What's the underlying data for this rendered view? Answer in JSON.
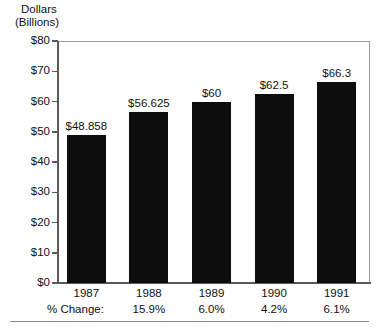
{
  "chart_data": {
    "type": "bar",
    "title": "",
    "ylabel_line1": "Dollars",
    "ylabel_line2": "(Billions)",
    "xlabel": "",
    "categories": [
      "1987",
      "1988",
      "1989",
      "1990",
      "1991"
    ],
    "values": [
      48.858,
      56.625,
      60,
      62.5,
      66.3
    ],
    "value_labels": [
      "$48.858",
      "$56.625",
      "$60",
      "$62.5",
      "$66.3"
    ],
    "percent_change_caption": "% Change:",
    "percent_change": [
      "",
      "15.9%",
      "6.0%",
      "4.2%",
      "6.1%"
    ],
    "ylim": [
      0,
      80
    ],
    "ytick_values": [
      0,
      10,
      20,
      30,
      40,
      50,
      60,
      70,
      80
    ],
    "ytick_labels": [
      "$0",
      "$10",
      "$20",
      "$30",
      "$40",
      "$50",
      "$60",
      "$70",
      "$80"
    ],
    "grid": false,
    "legend": "none",
    "bar_color": "#0d0d0d",
    "frame_color": "#9a9a9a",
    "text_color": "#111111"
  }
}
